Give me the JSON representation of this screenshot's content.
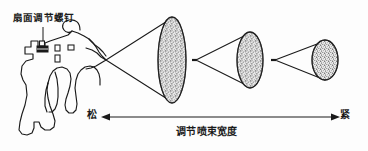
{
  "diagram": {
    "title_text": "扇面调节螺钉",
    "callout_label": "扇面调节螺钉",
    "scale_left_label": "松",
    "scale_right_label": "紧",
    "scale_center_label": "调节喷束宽度",
    "colors": {
      "background": "#fdfdfd",
      "stroke": "#1a1a1a",
      "stipple_fill": "#9a9a9a",
      "stipple_dark": "#4a4a4a",
      "text": "#1a1a1a"
    },
    "spray_patterns": [
      {
        "name": "wide-fan",
        "cx": 172,
        "cy": 60,
        "rx": 14,
        "ry": 43
      },
      {
        "name": "medium-fan",
        "cx": 250,
        "cy": 60,
        "rx": 13,
        "ry": 28
      },
      {
        "name": "narrow-fan",
        "cx": 325,
        "cy": 60,
        "rx": 13,
        "ry": 20
      }
    ],
    "cone_apexes": [
      {
        "name": "cone-apex-1",
        "x": 106,
        "y": 60
      },
      {
        "name": "cone-apex-2",
        "x": 196,
        "y": 60
      },
      {
        "name": "cone-apex-3",
        "x": 275,
        "y": 60
      }
    ],
    "scale_arrow": {
      "x1": 103,
      "x2": 338,
      "y": 117
    },
    "callout": {
      "line_x": 45,
      "line_y_top": 27,
      "line_y_bottom": 47,
      "screw_x": 42,
      "screw_y": 48
    }
  }
}
